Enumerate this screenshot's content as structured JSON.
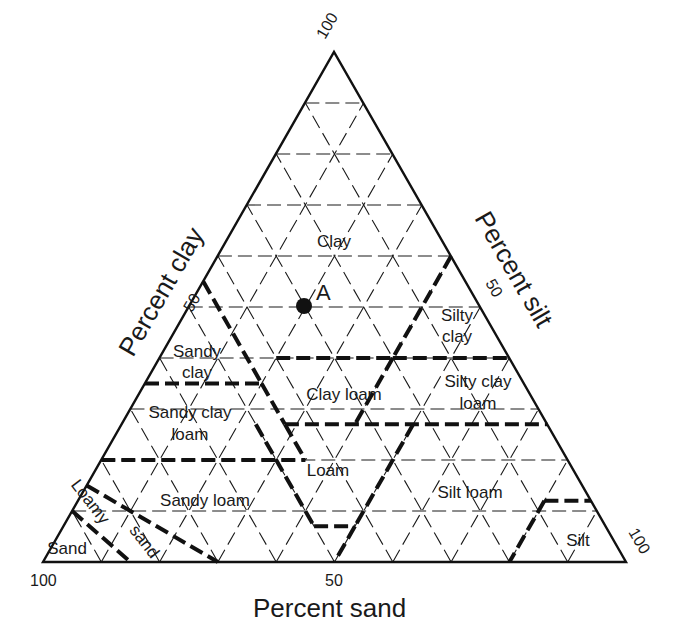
{
  "chart_data": {
    "type": "ternary",
    "title": "",
    "axes": {
      "clay": {
        "label": "Percent clay",
        "ticks": [
          "50",
          "100"
        ],
        "vertex": "top"
      },
      "silt": {
        "label": "Percent silt",
        "ticks": [
          "50",
          "100"
        ],
        "vertex": "bottom-right"
      },
      "sand": {
        "label": "Percent sand",
        "ticks": [
          "100",
          "50"
        ],
        "vertex": "bottom-left"
      }
    },
    "grid": {
      "on": true,
      "interval": 10
    },
    "regions": [
      {
        "name": "Clay",
        "label_lines": [
          "Clay"
        ]
      },
      {
        "name": "Sandy clay",
        "label_lines": [
          "Sandy",
          "clay"
        ]
      },
      {
        "name": "Silty clay",
        "label_lines": [
          "Silty",
          "clay"
        ]
      },
      {
        "name": "Sandy clay loam",
        "label_lines": [
          "Sandy clay",
          "loam"
        ]
      },
      {
        "name": "Clay loam",
        "label_lines": [
          "Clay loam"
        ]
      },
      {
        "name": "Silty clay loam",
        "label_lines": [
          "Silty clay",
          "loam"
        ]
      },
      {
        "name": "Loam",
        "label_lines": [
          "Loam"
        ]
      },
      {
        "name": "Sandy loam",
        "label_lines": [
          "Sandy loam"
        ]
      },
      {
        "name": "Silt loam",
        "label_lines": [
          "Silt loam"
        ]
      },
      {
        "name": "Loamy sand",
        "label_lines": [
          "Loamy",
          "sand"
        ]
      },
      {
        "name": "Sand",
        "label_lines": [
          "Sand"
        ]
      },
      {
        "name": "Silt",
        "label_lines": [
          "Silt"
        ]
      }
    ],
    "points": [
      {
        "label": "A",
        "clay": 50,
        "silt": 20,
        "sand": 30
      }
    ],
    "boundaries": [
      {
        "between": "Clay / Sandy clay",
        "path_clay_silt": [
          [
            55,
            0
          ],
          [
            35,
            20
          ]
        ]
      },
      {
        "between": "Clay / Clay loam, Silty clay",
        "path_clay_silt": [
          [
            40,
            15
          ],
          [
            40,
            40
          ]
        ]
      },
      {
        "between": "Clay / Silty clay",
        "path_clay_silt": [
          [
            40,
            40
          ],
          [
            60,
            40
          ]
        ]
      },
      {
        "between": "Silty clay / Silty clay loam",
        "path_clay_silt": [
          [
            40,
            40
          ],
          [
            40,
            60
          ]
        ]
      },
      {
        "between": "Sandy clay / Sandy clay loam",
        "path_clay_silt": [
          [
            35,
            0
          ],
          [
            35,
            20
          ]
        ]
      },
      {
        "between": "Clay loam / Loam row",
        "path_clay_silt": [
          [
            27,
            28
          ],
          [
            27,
            0
          ]
        ]
      },
      {
        "between": "Sandy clay loam / Sandy loam",
        "path_clay_silt": [
          [
            20,
            0
          ],
          [
            20,
            28
          ]
        ]
      },
      {
        "between": "Silty clay loam / Silt loam",
        "path_clay_silt": [
          [
            27,
            73
          ],
          [
            27,
            50
          ]
        ]
      },
      {
        "between": "Loam / Silt loam",
        "path_clay_silt": [
          [
            27,
            50
          ],
          [
            7,
            50
          ],
          [
            0,
            50
          ]
        ]
      },
      {
        "between": "Loam / Sandy loam",
        "path_clay_silt": [
          [
            20,
            28
          ],
          [
            7,
            41
          ],
          [
            7,
            50
          ]
        ]
      },
      {
        "between": "Silt / Silt loam",
        "path_clay_silt": [
          [
            12,
            80
          ],
          [
            12,
            88
          ],
          [
            0,
            80
          ]
        ]
      },
      {
        "between": "Loamy sand / Sandy loam",
        "path_clay_silt": [
          [
            15,
            0
          ],
          [
            0,
            30
          ]
        ]
      },
      {
        "between": "Sand / Loamy sand",
        "path_clay_silt": [
          [
            10,
            0
          ],
          [
            0,
            15
          ]
        ]
      }
    ]
  }
}
